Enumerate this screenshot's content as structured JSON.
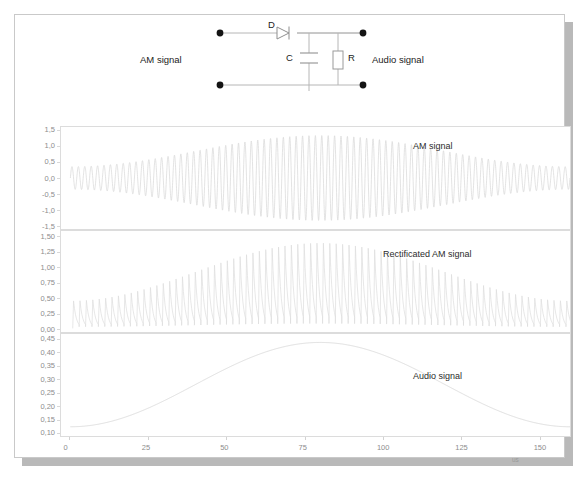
{
  "figure": {
    "background": "#ffffff",
    "border_color": "#c9c9c9",
    "shadow_color": "#b9b9b9"
  },
  "circuit": {
    "name": "am-envelope-detector",
    "components": [
      {
        "id": "D",
        "label": "D",
        "type": "diode"
      },
      {
        "id": "C",
        "label": "C",
        "type": "capacitor"
      },
      {
        "id": "R",
        "label": "R",
        "type": "resistor"
      }
    ],
    "port_left_label": "AM signal",
    "port_right_label": "Audio signal",
    "wire_color": "#b6b6b6",
    "node_color": "#141414"
  },
  "axes": {
    "x": {
      "label": "",
      "unit": "us",
      "ticks": [
        0,
        25,
        50,
        75,
        100,
        125,
        150
      ],
      "tick_labels": [
        "0",
        "25",
        "50",
        "75",
        "100",
        "125",
        "150"
      ],
      "min": -3,
      "max": 160
    }
  },
  "chart_data": [
    {
      "type": "line",
      "name": "am-signal",
      "title": "AM signal",
      "xlabel": "",
      "ylabel": "",
      "xunit": "us",
      "xlim": [
        -3,
        160
      ],
      "ylim": [
        -1.62,
        1.62
      ],
      "grid": false,
      "ytick_labels": [
        "1,5",
        "1,0",
        "0,5",
        "0,0",
        "-0,5",
        "-1,0",
        "-1,5"
      ],
      "yticks": [
        1.5,
        1.0,
        0.5,
        0.0,
        -0.5,
        -1.0,
        -1.5
      ],
      "description": "Amplitude modulated carrier: 1,25 kHz audio tone modulating a high-frequency carrier; envelope swings from about 0,12 to 0,45 of normalised amplitude",
      "carrier_periods": 78,
      "envelope_dc": 0.0,
      "envelope_min": 0.12,
      "envelope_max": 0.45,
      "modulation_phase_deg": -90,
      "line_color": "#d7d7d7"
    },
    {
      "type": "line",
      "name": "rectificated-am-signal",
      "title": "Rectificated AM signal",
      "xlabel": "",
      "ylabel": "",
      "xunit": "us",
      "xlim": [
        -3,
        160
      ],
      "ylim": [
        -0.06,
        1.6
      ],
      "grid": false,
      "ytick_labels": [
        "1,50",
        "1,25",
        "1,00",
        "0,75",
        "0,50",
        "0,25",
        "0,00"
      ],
      "yticks": [
        1.5,
        1.25,
        1.0,
        0.75,
        0.5,
        0.25,
        0.0
      ],
      "description": "Half-wave rectified carrier with RC discharge between peaks; peak envelope rises from about 0,45 to 1,40 then falls back to 1,15",
      "carrier_periods": 78,
      "peak_min": 0.45,
      "peak_max": 1.4,
      "discharge_fraction": 0.62,
      "line_color": "#dcdcdc"
    },
    {
      "type": "line",
      "name": "audio-signal",
      "title": "Audio signal",
      "xlabel": "",
      "ylabel": "",
      "xunit": "us",
      "xlim": [
        -3,
        160
      ],
      "ylim": [
        0.085,
        0.472
      ],
      "grid": false,
      "ytick_labels": [
        "0,45",
        "0,40",
        "0,35",
        "0,30",
        "0,25",
        "0,20",
        "0,15",
        "0,10"
      ],
      "yticks": [
        0.45,
        0.4,
        0.35,
        0.3,
        0.25,
        0.2,
        0.15,
        0.1
      ],
      "description": "Recovered audio: single sine cycle, minimum about 0,12 near 0 us, maximum about 0,44 near 62 us",
      "audio_min": 0.12,
      "audio_max": 0.44,
      "period_us": 160,
      "phase_deg": -90,
      "line_color": "#d5d5d5"
    }
  ]
}
